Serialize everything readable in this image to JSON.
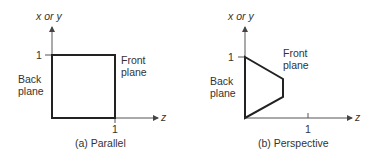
{
  "colors": {
    "axis": "#555555",
    "shape": "#222222",
    "text": "#333333"
  },
  "panels": [
    {
      "id": "parallel",
      "caption": "(a) Parallel",
      "y_axis_label": "x or y",
      "x_axis_label": "z",
      "y_tick": "1",
      "x_tick": "1",
      "back_plane": [
        "Back",
        "plane"
      ],
      "front_plane": [
        "Front",
        "plane"
      ]
    },
    {
      "id": "perspective",
      "caption": "(b) Perspective",
      "y_axis_label": "x or y",
      "x_axis_label": "z",
      "y_tick": "1",
      "x_tick": "1",
      "back_plane": [
        "Back",
        "plane"
      ],
      "front_plane": [
        "Front",
        "plane"
      ]
    }
  ]
}
